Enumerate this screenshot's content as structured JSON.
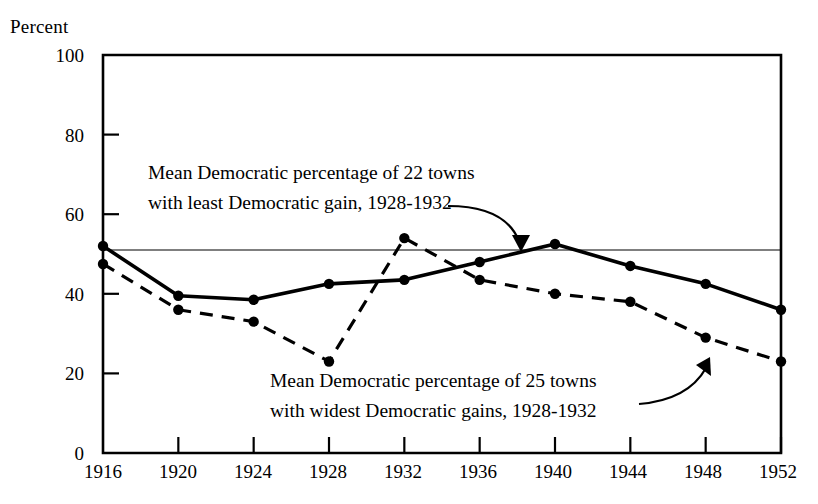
{
  "chart_data": {
    "type": "line",
    "title": "",
    "xlabel": "",
    "ylabel": "Percent",
    "x": [
      1916,
      1920,
      1924,
      1928,
      1932,
      1936,
      1940,
      1944,
      1948,
      1952
    ],
    "xtick_labels": [
      "1916",
      "1920",
      "1924",
      "1928",
      "1932",
      "1936",
      "1940",
      "1944",
      "1948",
      "1952"
    ],
    "ytick_labels": [
      "0",
      "20",
      "40",
      "60",
      "80",
      "100"
    ],
    "yticks": [
      0,
      20,
      40,
      60,
      80,
      100
    ],
    "ylim": [
      0,
      100
    ],
    "xlim": [
      1916,
      1952
    ],
    "grid": false,
    "legend_position": "inline-annotations",
    "series": [
      {
        "name": "Mean Democratic percentage of  22 towns with least Democratic gain, 1928-1932",
        "style": "solid",
        "marker": "filled-circle",
        "color": "#000000",
        "values": [
          52.0,
          39.5,
          38.5,
          42.5,
          43.5,
          48.0,
          52.5,
          47.0,
          42.5,
          36.0
        ]
      },
      {
        "name": "Mean Democratic percentage of  25 towns with widest Democratic gains, 1928-1932",
        "style": "dashed",
        "marker": "filled-circle",
        "color": "#000000",
        "values": [
          47.5,
          36.0,
          33.0,
          23.0,
          54.0,
          43.5,
          40.0,
          38.0,
          29.0,
          23.0
        ]
      }
    ],
    "reference_line": {
      "name": "horizontal-reference-line",
      "value": 51.0,
      "style": "thin-solid"
    },
    "annotations": [
      {
        "id": "upper",
        "line1": "Mean Democratic percentage of  22 towns",
        "line2": "with least Democratic gain, 1928-1932",
        "points_to": "solid-series-1940-peak"
      },
      {
        "id": "lower",
        "line1": "Mean Democratic percentage of  25 towns",
        "line2": "with widest Democratic gains, 1928-1932",
        "points_to": "dashed-series-1948-segment"
      }
    ]
  }
}
